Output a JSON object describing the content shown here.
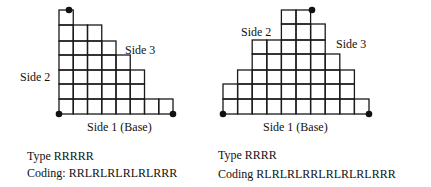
{
  "figures": [
    {
      "id": "left",
      "type_label": "Type RRRRR",
      "coding_label": "Coding: RRLRLRLRLRLRRR",
      "base_label": "Side 1 (Base)",
      "side2_label": "Side 2",
      "side3_label": "Side 3",
      "grid": {
        "origin_x": 59,
        "bottom_y": 114,
        "cell_w": 14.25,
        "row_tops": [
          10,
          25,
          41,
          55,
          70,
          84,
          99
        ],
        "rows": [
          {
            "start": 0,
            "cells": 1
          },
          {
            "start": 0,
            "cells": 3
          },
          {
            "start": 0,
            "cells": 4
          },
          {
            "start": 0,
            "cells": 5
          },
          {
            "start": 0,
            "cells": 6
          },
          {
            "start": 0,
            "cells": 6
          },
          {
            "start": 0,
            "cells": 8
          }
        ]
      },
      "dots": [
        [
          69,
          10
        ],
        [
          59,
          114
        ],
        [
          173,
          114
        ]
      ],
      "label_pos": {
        "base": [
          87,
          131
        ],
        "side2": [
          20,
          81
        ],
        "side3": [
          125,
          54
        ],
        "type": [
          27,
          160
        ],
        "coding": [
          27,
          177
        ]
      }
    },
    {
      "id": "right",
      "type_label": "Type RRRR",
      "coding_label": "Coding RLRLRLRRLRLRLRLRRR",
      "base_label": "Side 1 (Base)",
      "side2_label": "Side 2",
      "side3_label": "Side 3",
      "grid": {
        "origin_x": 223,
        "bottom_y": 114,
        "cell_w": 14.6,
        "row_tops": [
          10,
          24,
          40,
          54,
          70,
          84,
          99
        ],
        "rows": [
          {
            "start": 4,
            "cells": 2
          },
          {
            "start": 4,
            "cells": 3
          },
          {
            "start": 2,
            "cells": 5
          },
          {
            "start": 2,
            "cells": 6
          },
          {
            "start": 1,
            "cells": 8
          },
          {
            "start": 0,
            "cells": 9
          },
          {
            "start": 0,
            "cells": 10
          }
        ]
      },
      "dots": [
        [
          312,
          10
        ],
        [
          223,
          114
        ],
        [
          369,
          114
        ]
      ],
      "label_pos": {
        "base": [
          263,
          131
        ],
        "side2": [
          241,
          36
        ],
        "side3": [
          336,
          48
        ],
        "type": [
          218,
          159
        ],
        "coding": [
          218,
          178
        ]
      }
    }
  ]
}
